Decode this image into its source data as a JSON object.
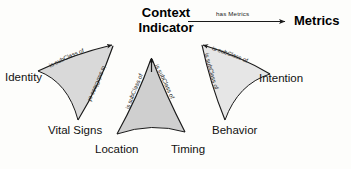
{
  "diagram": {
    "title_node": {
      "line1": "Context",
      "line2": "Indicator"
    },
    "metrics_node": {
      "label": "Metrics"
    },
    "has_metrics_edge": {
      "label": "has Metrics"
    },
    "subclass_label": "is subClass of",
    "groups": [
      {
        "name": "identity-group",
        "fill": "#d9d9d9",
        "leaves": [
          {
            "label": "Identity"
          },
          {
            "label": "Vital Signs"
          }
        ],
        "edges": [
          {
            "label": "is subClass of"
          },
          {
            "label": "is subClass of"
          }
        ]
      },
      {
        "name": "location-group",
        "fill": "#cfcfcf",
        "leaves": [
          {
            "label": "Location"
          },
          {
            "label": "Timing"
          }
        ],
        "edges": [
          {
            "label": "is subClass of"
          },
          {
            "label": "is subClass of"
          }
        ]
      },
      {
        "name": "intention-group",
        "fill": "#e6e6e6",
        "leaves": [
          {
            "label": "Intention"
          },
          {
            "label": "Behavior"
          }
        ],
        "edges": [
          {
            "label": "is subClass of"
          },
          {
            "label": "is subClass of"
          }
        ]
      }
    ],
    "colors": {
      "background": "#fdfdfb",
      "stroke": "#1a1a1a",
      "text": "#111111",
      "fill_light": "#e6e6e6",
      "fill_mid": "#d9d9d9",
      "fill_dark": "#cfcfcf"
    }
  }
}
